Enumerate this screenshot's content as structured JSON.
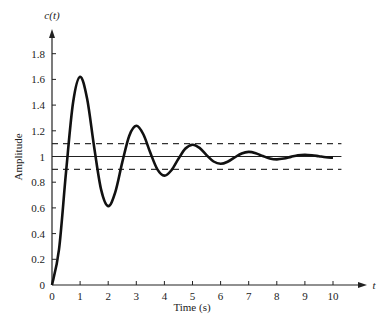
{
  "chart_data": {
    "type": "line",
    "title": "",
    "xlabel": "Time (s)",
    "ylabel": "Amplitude",
    "x_axis_variable": "t",
    "y_axis_variable": "c(t)",
    "xlim": [
      0,
      10
    ],
    "ylim": [
      0,
      1.8
    ],
    "x_ticks": [
      "0",
      "1",
      "2",
      "3",
      "4",
      "5",
      "6",
      "7",
      "8",
      "9",
      "10"
    ],
    "y_ticks": [
      "0",
      "0.2",
      "0.4",
      "0.6",
      "0.8",
      "1",
      "1.2",
      "1.4",
      "1.6",
      "1.8"
    ],
    "grid": false,
    "legend": null,
    "series": [
      {
        "name": "c(t) step response",
        "style": "solid-thick",
        "x": [
          0,
          0.25,
          0.5,
          0.75,
          1,
          1.25,
          1.5,
          1.75,
          2,
          2.25,
          2.5,
          2.75,
          3,
          3.25,
          3.5,
          3.75,
          4,
          4.25,
          4.5,
          4.75,
          5,
          5.25,
          5.5,
          5.75,
          6,
          6.25,
          6.5,
          6.75,
          7,
          7.25,
          7.5,
          7.75,
          8,
          8.25,
          8.5,
          8.75,
          9,
          9.25,
          9.5,
          9.75,
          10
        ],
        "values": [
          0,
          0.277,
          0.88,
          1.42,
          1.621,
          1.449,
          1.074,
          0.74,
          0.614,
          0.721,
          0.954,
          1.162,
          1.239,
          1.173,
          1.029,
          0.9,
          0.851,
          0.893,
          0.982,
          1.062,
          1.092,
          1.067,
          1.011,
          0.961,
          0.943,
          0.959,
          0.993,
          1.024,
          1.036,
          1.026,
          1.004,
          0.985,
          0.978,
          0.984,
          0.997,
          1.01,
          1.014,
          1.01,
          1.002,
          0.994,
          0.991
        ]
      },
      {
        "name": "final value",
        "style": "solid-thin",
        "x": [
          0,
          10.3
        ],
        "values": [
          1,
          1
        ]
      },
      {
        "name": "upper tolerance",
        "style": "dashed",
        "x": [
          0,
          10.3
        ],
        "values": [
          1.1,
          1.1
        ]
      },
      {
        "name": "lower tolerance",
        "style": "dashed",
        "x": [
          0,
          10.3
        ],
        "values": [
          0.9,
          0.9
        ]
      }
    ],
    "annotations": []
  },
  "axes": {
    "x_label": "Time (s)",
    "y_label": "Amplitude",
    "x_var": "t",
    "y_var": "c(t)"
  },
  "colors": {
    "curve": "#111111",
    "axis": "#222222",
    "dashed": "#333333",
    "background": "#ffffff"
  }
}
